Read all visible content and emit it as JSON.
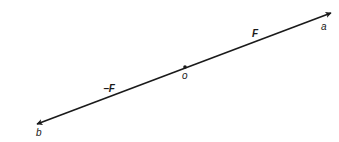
{
  "diagram": {
    "title": "",
    "line_color": "#1a1a1a",
    "labels": {
      "point_a": "a",
      "point_b": "b",
      "origin": "o",
      "force": "F",
      "neg_force": "−F"
    },
    "points": {
      "a": [
        331,
        13
      ],
      "b": [
        37,
        124
      ],
      "o": [
        185,
        67
      ]
    }
  }
}
